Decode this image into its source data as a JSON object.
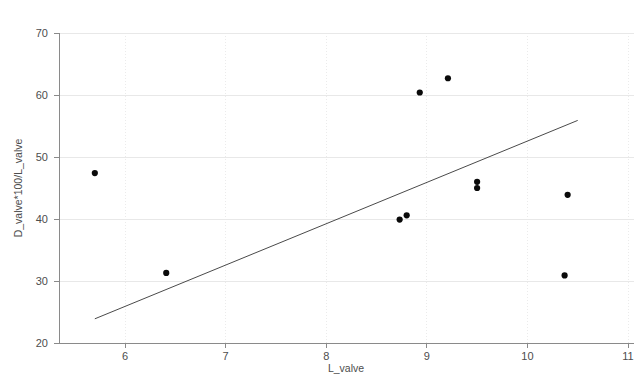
{
  "chart_data": {
    "type": "scatter",
    "title": "",
    "xlabel": "L_valve",
    "ylabel": "D_valve*100/L_valve",
    "xlim": [
      5.5,
      11
    ],
    "ylim": [
      20,
      72
    ],
    "grid": true,
    "legend": null,
    "x_ticks": [
      "6",
      "7",
      "8",
      "9",
      "10",
      "11"
    ],
    "x_tick_values": [
      6,
      7,
      8,
      9,
      10,
      11
    ],
    "y_ticks": [
      "20",
      "30",
      "40",
      "50",
      "60",
      "70"
    ],
    "y_tick_values": [
      20,
      30,
      40,
      50,
      60,
      70
    ],
    "series": [
      {
        "name": "observations",
        "marker": "filled-circle",
        "color": "#0a0a0a",
        "points": [
          {
            "x": 5.7,
            "y": 47.4
          },
          {
            "x": 6.41,
            "y": 31.3
          },
          {
            "x": 8.73,
            "y": 39.9
          },
          {
            "x": 8.8,
            "y": 40.6
          },
          {
            "x": 8.93,
            "y": 60.4
          },
          {
            "x": 9.21,
            "y": 62.7
          },
          {
            "x": 9.5,
            "y": 46.0
          },
          {
            "x": 9.5,
            "y": 45.0
          },
          {
            "x": 10.37,
            "y": 30.9
          },
          {
            "x": 10.4,
            "y": 43.9
          }
        ]
      },
      {
        "name": "regression-line",
        "type": "line",
        "color": "#4a4a4a",
        "points": [
          {
            "x": 5.7,
            "y": 23.9
          },
          {
            "x": 10.5,
            "y": 55.9
          }
        ]
      }
    ]
  },
  "figure": {
    "caption": ""
  }
}
